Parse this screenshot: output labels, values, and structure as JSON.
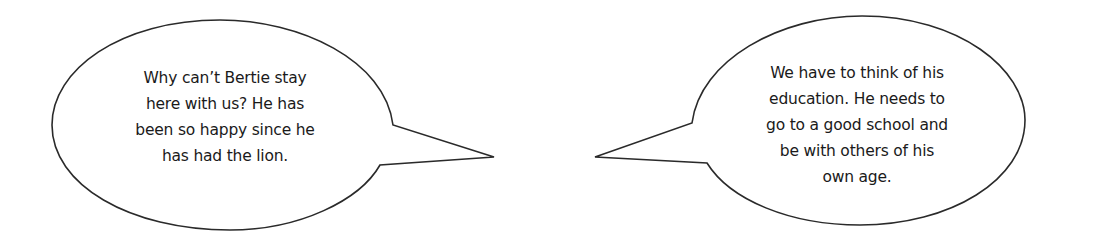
{
  "speech_bubbles": [
    {
      "id": "left",
      "tail_direction": "right",
      "lines": [
        "Why can’t Bertie stay",
        "here with us? He has",
        "been so happy since he",
        "has had the lion."
      ]
    },
    {
      "id": "right",
      "tail_direction": "left",
      "lines": [
        "We have to think of his",
        "education. He needs to",
        "go to a good school and",
        "be with others of his",
        "own age."
      ]
    }
  ],
  "colors": {
    "background": "#ffffff",
    "outline": "#2a2a2a",
    "text": "#1a1a1a"
  }
}
